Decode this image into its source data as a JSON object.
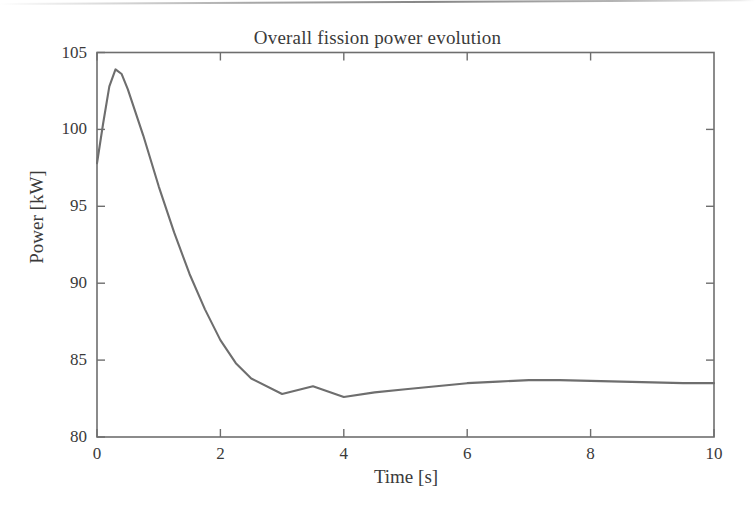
{
  "figure": {
    "background_color": "#ffffff",
    "artifact": "scanned-page-top-edge-line"
  },
  "chart_data": {
    "type": "line",
    "title": "Overall fission power evolution",
    "xlabel": "Time [s]",
    "ylabel": "Power [kW]",
    "xlim": [
      0,
      10
    ],
    "ylim": [
      80,
      105
    ],
    "xticks": [
      0,
      2,
      4,
      6,
      8,
      10
    ],
    "yticks": [
      80,
      85,
      90,
      95,
      100,
      105
    ],
    "xtick_labels": [
      "0",
      "2",
      "4",
      "6",
      "8",
      "10"
    ],
    "ytick_labels": [
      "80",
      "85",
      "90",
      "95",
      "100",
      "105"
    ],
    "grid": false,
    "legend": null,
    "legend_position": "none",
    "line_color": "#6e6e6e",
    "line_width": 2,
    "series": [
      {
        "name": "Overall fission power",
        "x": [
          0.0,
          0.1,
          0.2,
          0.3,
          0.4,
          0.5,
          0.75,
          1.0,
          1.25,
          1.5,
          1.75,
          2.0,
          2.25,
          2.5,
          3.0,
          3.5,
          4.0,
          4.5,
          5.0,
          5.5,
          6.0,
          6.5,
          7.0,
          7.5,
          8.0,
          8.5,
          9.0,
          9.5,
          10.0
        ],
        "y": [
          97.8,
          100.4,
          102.8,
          103.9,
          103.6,
          102.6,
          99.6,
          96.3,
          93.3,
          90.6,
          88.3,
          86.3,
          84.8,
          83.8,
          82.8,
          83.3,
          82.6,
          82.9,
          83.1,
          83.3,
          83.5,
          83.6,
          83.7,
          83.7,
          83.65,
          83.6,
          83.55,
          83.5,
          83.5
        ]
      }
    ],
    "annotations": {
      "initial_value": 97.8,
      "peak_value": 103.9,
      "peak_time": 0.3,
      "first_minimum_value": 82.8,
      "first_minimum_time": 3.0,
      "local_bump_value": 83.3,
      "local_bump_time": 3.5,
      "second_minimum_value": 82.6,
      "second_minimum_time": 4.0,
      "final_value": 83.5,
      "final_time": 10.0
    }
  }
}
